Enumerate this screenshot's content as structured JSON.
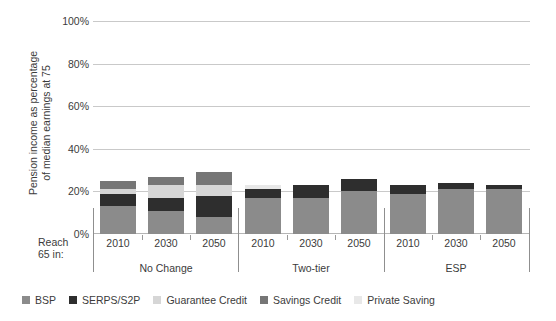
{
  "chart_data": {
    "type": "bar",
    "title": "",
    "subtitle": "",
    "xlabel": "Reach 65 in:",
    "ylabel": "Pension income as percentage\nof median earnings at 75",
    "ylim": [
      0,
      100
    ],
    "ytick_labels": [
      "0%",
      "20%",
      "40%",
      "60%",
      "80%",
      "100%"
    ],
    "ytick_values": [
      0,
      20,
      40,
      60,
      80,
      100
    ],
    "grid": "horizontal",
    "stacked": true,
    "legend_position": "bottom",
    "categories": [
      "2010",
      "2030",
      "2050",
      "2010",
      "2030",
      "2050",
      "2010",
      "2030",
      "2050"
    ],
    "groups": [
      {
        "label": "No Change",
        "categories": [
          "2010",
          "2030",
          "2050"
        ]
      },
      {
        "label": "Two-tier",
        "categories": [
          "2010",
          "2030",
          "2050"
        ]
      },
      {
        "label": "ESP",
        "categories": [
          "2010",
          "2030",
          "2050"
        ]
      }
    ],
    "series": [
      {
        "name": "BSP",
        "color": "#8b8b8b",
        "values": [
          13,
          11,
          8,
          17,
          17,
          20,
          19,
          21,
          21
        ]
      },
      {
        "name": "SERPS/S2P",
        "color": "#2e2e2e",
        "values": [
          6,
          6,
          10,
          4,
          6,
          6,
          4,
          3,
          2
        ]
      },
      {
        "name": "Guarantee Credit",
        "color": "#d6d6d6",
        "values": [
          2,
          6,
          5,
          0,
          0,
          0,
          0,
          0,
          0
        ]
      },
      {
        "name": "Savings Credit",
        "color": "#767676",
        "values": [
          4,
          4,
          6,
          0,
          0,
          0,
          0,
          0,
          0
        ]
      },
      {
        "name": "Private Saving",
        "color": "#e8e8e8",
        "values": [
          0,
          0,
          0,
          2,
          0,
          0,
          0,
          0,
          0
        ]
      }
    ],
    "totals": [
      25,
      27,
      29,
      23,
      23,
      26,
      23,
      24,
      23
    ]
  },
  "axis": {
    "y_title_line1": "Pension income as percentage",
    "y_title_line2": "of median earnings at 75",
    "y_title": "Pension income as percentage\nof median earnings at 75",
    "reach_label": "Reach\n65 in:",
    "ticks": {
      "t100": "100%",
      "t80": "80%",
      "t60": "60%",
      "t40": "40%",
      "t20": "20%",
      "t0": "0%"
    },
    "year_labels": [
      "2010",
      "2030",
      "2050",
      "2010",
      "2030",
      "2050",
      "2010",
      "2030",
      "2050"
    ],
    "group_labels": [
      "No Change",
      "Two-tier",
      "ESP"
    ]
  },
  "legend": {
    "items": [
      {
        "label": "BSP",
        "color": "#8b8b8b"
      },
      {
        "label": "SERPS/S2P",
        "color": "#2e2e2e"
      },
      {
        "label": "Guarantee Credit",
        "color": "#d6d6d6"
      },
      {
        "label": "Savings Credit",
        "color": "#767676"
      },
      {
        "label": "Private Saving",
        "color": "#e8e8e8"
      }
    ]
  },
  "colors": {
    "grid": "#c9c9c9",
    "axis": "#8f8f8f",
    "text": "#3b3b3b",
    "background": "#ffffff"
  }
}
